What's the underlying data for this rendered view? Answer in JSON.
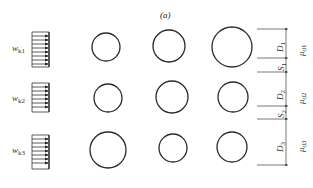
{
  "figure": {
    "caption": "(a)",
    "rows": [
      {
        "load_label": "w",
        "load_sub": "k1",
        "circles": [
          {
            "cx": 106,
            "cy": 47,
            "r": 14
          },
          {
            "cx": 169,
            "cy": 46,
            "r": 16
          },
          {
            "cx": 232,
            "cy": 47,
            "r": 20
          }
        ],
        "dimension": {
          "label": "D",
          "sub": "1"
        },
        "mu": {
          "label": "μ",
          "sub": "d1"
        }
      },
      {
        "load_label": "w",
        "load_sub": "k2",
        "circles": [
          {
            "cx": 108,
            "cy": 98,
            "r": 14
          },
          {
            "cx": 172,
            "cy": 97,
            "r": 16
          },
          {
            "cx": 233,
            "cy": 97,
            "r": 15
          }
        ],
        "spacing": {
          "label": "S",
          "sub": "1"
        },
        "dimension": {
          "label": "D",
          "sub": "2"
        },
        "mu": {
          "label": "μ",
          "sub": "d2"
        }
      },
      {
        "load_label": "w",
        "load_sub": "k3",
        "circles": [
          {
            "cx": 108,
            "cy": 150,
            "r": 18
          },
          {
            "cx": 173,
            "cy": 148,
            "r": 14
          },
          {
            "cx": 232,
            "cy": 147,
            "r": 15
          }
        ],
        "spacing": {
          "label": "S",
          "sub": "2"
        },
        "dimension": {
          "label": "D",
          "sub": "3"
        },
        "mu": {
          "label": "μ",
          "sub": "d3"
        }
      }
    ],
    "colors": {
      "stroke": "#2a2a2a",
      "dim_line": "#555555",
      "background": "#ffffff"
    }
  }
}
